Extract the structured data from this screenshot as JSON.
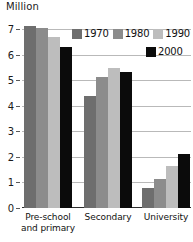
{
  "chart_data": {
    "type": "bar",
    "title": "",
    "subtitle": "",
    "xlabel": "",
    "ylabel": "Million",
    "ylim": [
      0,
      7.45
    ],
    "yticks": [
      0,
      1,
      2,
      3,
      4,
      5,
      6,
      7
    ],
    "ytick_labels": [
      "0",
      "1",
      "2",
      "3",
      "4",
      "5",
      "6",
      "7"
    ],
    "grid": true,
    "legend_position": "top-right",
    "categories": [
      "Pre-school and primary",
      "Secondary",
      "University"
    ],
    "series": [
      {
        "name": "1970",
        "color": "#6e6e6e",
        "values": [
          7.15,
          4.4,
          0.8
        ]
      },
      {
        "name": "1980",
        "color": "#8c8c8c",
        "values": [
          7.05,
          5.15,
          1.15
        ]
      },
      {
        "name": "1990",
        "color": "#bdbdbd",
        "values": [
          6.7,
          5.5,
          1.65
        ]
      },
      {
        "name": "2000",
        "color": "#0b0b0b",
        "values": [
          6.3,
          5.35,
          2.1
        ]
      }
    ]
  },
  "axis": {
    "unit_label": "Million",
    "tick_0": "0",
    "tick_1": "1",
    "tick_2": "2",
    "tick_3": "3",
    "tick_4": "4",
    "tick_5": "5",
    "tick_6": "6",
    "tick_7": "7"
  },
  "categories": {
    "cat0_line1": "Pre-school",
    "cat0_line2": "and primary",
    "cat1_line1": "Secondary",
    "cat2_line1": "University"
  },
  "legend": {
    "row1": [
      {
        "label": "1970",
        "color": "#6e6e6e"
      },
      {
        "label": "1980",
        "color": "#8c8c8c"
      },
      {
        "label": "1990",
        "color": "#bdbdbd"
      }
    ],
    "row2": [
      {
        "label": "2000",
        "color": "#0b0b0b"
      }
    ]
  }
}
